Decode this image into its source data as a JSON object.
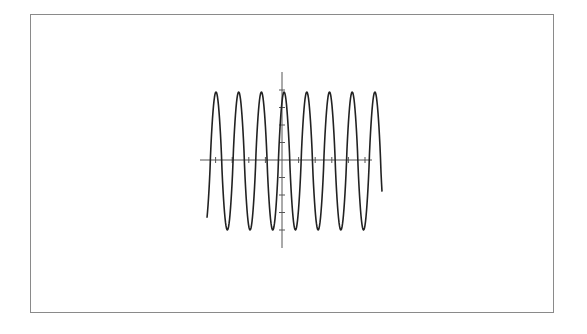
{
  "chart_data": {
    "type": "line",
    "title": "",
    "xlabel": "",
    "ylabel": "",
    "grid": false,
    "legend": null,
    "series": [
      {
        "name": "waveform",
        "color": "#222222",
        "amplitude": 1.0,
        "peaks": 8,
        "x_start": -3.5,
        "x_end": 5.9,
        "period": 1.35,
        "y_start": -0.65,
        "y_end": 0.2
      }
    ],
    "xlim": [
      -4.8,
      5.4
    ],
    "ylim": [
      -1.3,
      1.3
    ],
    "x_ticks_count": 9,
    "y_ticks_count": 9
  },
  "layout": {
    "frame_color": "#8a8a8a",
    "axis_color": "#555555",
    "curve_color": "#222222",
    "origin_px": [
      282,
      160
    ],
    "x_axis_px": [
      200,
      372
    ],
    "y_axis_px": [
      72,
      248
    ],
    "peak_y_px": 92,
    "trough_y_px": 230,
    "curve_x_px": [
      207,
      382
    ],
    "period_px": 22.7,
    "first_peak_x_px": 216,
    "x_tick_spacing_px": 16.6,
    "y_tick_spacing_px": 17.5
  }
}
